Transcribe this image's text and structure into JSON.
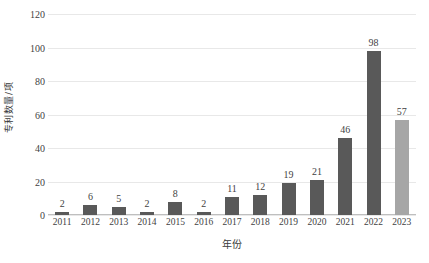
{
  "chart_data": {
    "type": "bar",
    "title": "",
    "subtitle": "",
    "xlabel": "年份",
    "ylabel": "专利数量/项",
    "categories": [
      "2011",
      "2012",
      "2013",
      "2014",
      "2015",
      "2016",
      "2017",
      "2018",
      "2019",
      "2020",
      "2021",
      "2022",
      "2023"
    ],
    "values": [
      2,
      6,
      5,
      2,
      8,
      2,
      11,
      12,
      19,
      21,
      46,
      98,
      57
    ],
    "data_labels": [
      "2",
      "6",
      "5",
      "2",
      "8",
      "2",
      "11",
      "12",
      "19",
      "21",
      "46",
      "98",
      "57"
    ],
    "bar_colors": [
      "#595959",
      "#595959",
      "#595959",
      "#595959",
      "#595959",
      "#595959",
      "#595959",
      "#595959",
      "#595959",
      "#595959",
      "#595959",
      "#595959",
      "#a6a6a6"
    ],
    "ylim": [
      0,
      120
    ],
    "ytick_labels": [
      "0",
      "20",
      "40",
      "60",
      "80",
      "100",
      "120"
    ],
    "ytick_values": [
      0,
      20,
      40,
      60,
      80,
      100,
      120
    ],
    "grid": true,
    "grid_axis": "y",
    "legend": null,
    "legend_position": "none",
    "background_color": "#ffffff",
    "gridline_color": "#e8e8e8",
    "axis_color": "#bfbfbf",
    "text_color": "#3f3f3f"
  }
}
